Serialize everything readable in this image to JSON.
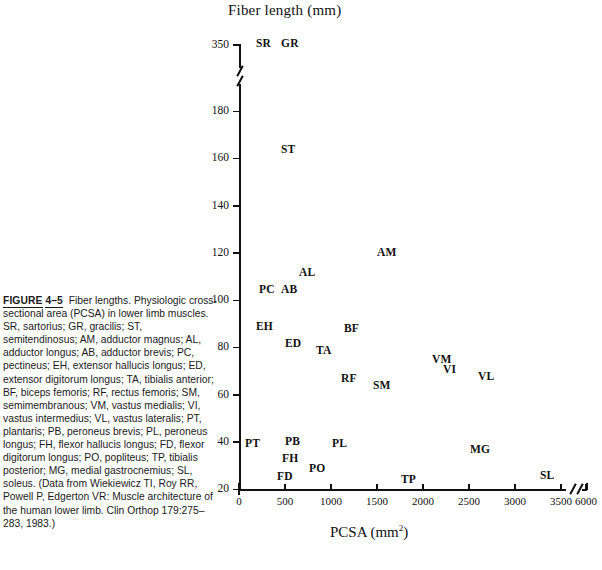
{
  "figure": {
    "label_prefix": "FIGURE",
    "number": "4–5",
    "caption": "Fiber lengths. Physiologic cross-sectional area (PCSA) in lower limb muscles. SR, sartorius; GR, gracilis; ST, semitendinosus; AM, adductor magnus; AL, adductor longus; AB, adductor brevis; PC, pectineus; EH, extensor hallucis longus; ED, extensor digitorum longus; TA, tibialis anterior; BF, biceps femoris; RF, rectus femoris; SM, semimembranous; VM, vastus medialis; VI, vastus intermedius; VL, vastus lateralis; PT, plantaris; PB, peroneus brevis; PL, peroneus longus; FH, flexor hallucis longus; FD, flexor digitorum longus; PO, popliteus; TP, tibialis posterior; MG, medial gastrocnemius; SL, soleus. (Data from Wiekiewicz TI, Roy RR, Powell P, Edgerton VR: Muscle architecture of the human lower limb. Clin Orthop 179:275–283, 1983.)"
  },
  "chart_data": {
    "type": "scatter",
    "title": "Fiber length (mm)",
    "xlabel": "PCSA (mm",
    "xlabel_sup": "2",
    "xlabel_close": ")",
    "ylabel": "Fiber length (mm)",
    "xlim": [
      0,
      6000
    ],
    "ylim": [
      20,
      350
    ],
    "grid": false,
    "legend": "none",
    "x_ticks": [
      0,
      500,
      1000,
      1500,
      2000,
      2500,
      3000,
      3500,
      6000
    ],
    "x_tick_labels": [
      "0",
      "500",
      "1000",
      "1500",
      "2000",
      "2500",
      "3000",
      "3500",
      "6000"
    ],
    "x_axis_break_between": [
      3500,
      6000
    ],
    "y_ticks": [
      20,
      40,
      60,
      80,
      100,
      120,
      140,
      160,
      180,
      350
    ],
    "y_tick_labels": [
      "20",
      "40",
      "60",
      "80",
      "100",
      "120",
      "140",
      "160",
      "180",
      "350"
    ],
    "y_axis_break_between": [
      180,
      350
    ],
    "points": [
      {
        "label": "SR",
        "name": "sartorius",
        "x": 170,
        "y": 355,
        "px": 256,
        "py": 37
      },
      {
        "label": "GR",
        "name": "gracilis",
        "x": 290,
        "y": 355,
        "px": 281,
        "py": 37
      },
      {
        "label": "ST",
        "name": "semitendinosus",
        "x": 400,
        "y": 158,
        "px": 281,
        "py": 143
      },
      {
        "label": "AM",
        "name": "adductor magnus",
        "x": 1870,
        "y": 119,
        "px": 377,
        "py": 246
      },
      {
        "label": "AL",
        "name": "adductor longus",
        "x": 630,
        "y": 108,
        "px": 299,
        "py": 266
      },
      {
        "label": "PC",
        "name": "pectineus",
        "x": 340,
        "y": 103,
        "px": 259,
        "py": 283
      },
      {
        "label": "AB",
        "name": "adductor brevis",
        "x": 520,
        "y": 103,
        "px": 281,
        "py": 283
      },
      {
        "label": "EH",
        "name": "extensor hallucis longus",
        "x": 260,
        "y": 85,
        "px": 256,
        "py": 320
      },
      {
        "label": "BF",
        "name": "biceps femoris",
        "x": 1080,
        "y": 85,
        "px": 344,
        "py": 322
      },
      {
        "label": "ED",
        "name": "extensor digitorum longus",
        "x": 530,
        "y": 80,
        "px": 285,
        "py": 337
      },
      {
        "label": "TA",
        "name": "tibialis anterior",
        "x": 800,
        "y": 77,
        "px": 316,
        "py": 344
      },
      {
        "label": "VM",
        "name": "vastus medialis",
        "x": 1940,
        "y": 72,
        "px": 432,
        "py": 353
      },
      {
        "label": "VI",
        "name": "vastus intermedius",
        "x": 2060,
        "y": 69,
        "px": 443,
        "py": 363
      },
      {
        "label": "RF",
        "name": "rectus femoris",
        "x": 1010,
        "y": 66,
        "px": 341,
        "py": 372
      },
      {
        "label": "VL",
        "name": "vastus lateralis",
        "x": 3000,
        "y": 67,
        "px": 478,
        "py": 370
      },
      {
        "label": "SM",
        "name": "semimembranous",
        "x": 1280,
        "y": 63,
        "px": 373,
        "py": 379
      },
      {
        "label": "PT",
        "name": "plantaris",
        "x": 80,
        "y": 40,
        "px": 245,
        "py": 437
      },
      {
        "label": "PB",
        "name": "peroneus brevis",
        "x": 530,
        "y": 41,
        "px": 285,
        "py": 435
      },
      {
        "label": "PL",
        "name": "peroneus longus",
        "x": 880,
        "y": 40,
        "px": 332,
        "py": 437
      },
      {
        "label": "MG",
        "name": "medial gastrocnemius",
        "x": 2960,
        "y": 39,
        "px": 470,
        "py": 443
      },
      {
        "label": "FH",
        "name": "flexor hallucis longus",
        "x": 520,
        "y": 34,
        "px": 282,
        "py": 452
      },
      {
        "label": "PO",
        "name": "popliteus",
        "x": 700,
        "y": 30,
        "px": 309,
        "py": 462
      },
      {
        "label": "FD",
        "name": "flexor digitorum longus",
        "x": 450,
        "y": 27,
        "px": 277,
        "py": 470
      },
      {
        "label": "TP",
        "name": "tibialis posterior",
        "x": 1900,
        "y": 26,
        "px": 401,
        "py": 473
      },
      {
        "label": "SL",
        "name": "soleus",
        "x": 5900,
        "y": 25,
        "px": 540,
        "py": 469
      }
    ]
  }
}
